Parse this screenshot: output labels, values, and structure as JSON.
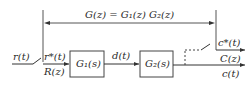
{
  "diagram": {
    "type": "sampled-data block diagram",
    "labels": {
      "transfer": "G(z) = G₁(z) G₂(z)",
      "input": "r(t)",
      "sampled_input": "r*(t)",
      "input_z": "R(z)",
      "block1": "G₁(s)",
      "intermediate": "d(t)",
      "block2": "G₂(s)",
      "sampled_output": "c*(t)",
      "output_z": "C(z)",
      "output": "c(t)"
    },
    "colors": {
      "line": "#333333",
      "background": "#ffffff"
    }
  }
}
